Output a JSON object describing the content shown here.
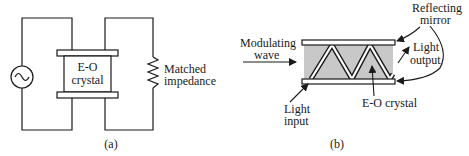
{
  "panel_a": {
    "crystal_label_line1": "E-O",
    "crystal_label_line2": "crystal",
    "impedance_label_line1": "Matched",
    "impedance_label_line2": "impedance",
    "caption": "(a)",
    "icons": {
      "source": "ac-source-icon",
      "resistor": "resistor-icon"
    }
  },
  "panel_b": {
    "modulating_line1": "Modulating",
    "modulating_line2": "wave",
    "mirror_line1": "Reflecting",
    "mirror_line2": "mirror",
    "output_line1": "Light",
    "output_line2": "output",
    "input_line1": "Light",
    "input_line2": "input",
    "crystal_label": "E-O crystal",
    "caption": "(b)"
  },
  "colors": {
    "line": "#1a1a1a",
    "crystal_fill": "#c8c8c8",
    "background": "#ffffff"
  }
}
